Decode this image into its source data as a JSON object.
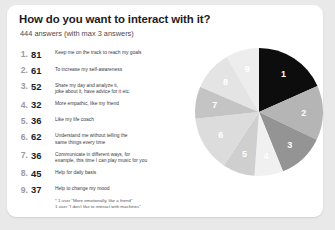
{
  "slide": {
    "title": "How do you want to interact with it?",
    "subtitle": "444 answers  (with max 3 answers)"
  },
  "answers": [
    {
      "rank": "1.",
      "count": "81",
      "text": "Keep me on the track to reach my goals"
    },
    {
      "rank": "2.",
      "count": "61",
      "text": "To increase my self-awareness"
    },
    {
      "rank": "3.",
      "count": "52",
      "text": "Share my day and analyze it,",
      "text2": "joke about it, have advice for it etc."
    },
    {
      "rank": "4.",
      "count": "32",
      "text": "More empathic, like my friend"
    },
    {
      "rank": "5.",
      "count": "36",
      "text": "Like my life coach"
    },
    {
      "rank": "6.",
      "count": "62",
      "text": "Understand me without telling the",
      "text2": "same things every time"
    },
    {
      "rank": "7.",
      "count": "36",
      "text": "Communicate in different ways, for",
      "text2": "example, this time I can play music for you"
    },
    {
      "rank": "8.",
      "count": "45",
      "text": "Help for daily basis"
    },
    {
      "rank": "9.",
      "count": "37",
      "text": "Help to change my mood"
    }
  ],
  "footnotes": [
    "* 1 user \"More emotionally, like a friend\"",
    "1 user \"I don't like to interact with machines\""
  ],
  "chart_data": {
    "type": "pie",
    "title": "How do you want to interact with it?",
    "total": 444,
    "categories": [
      "Keep me on the track to reach my goals",
      "To increase my self-awareness",
      "Share my day and analyze it, joke about it, have advice for it etc.",
      "More empathic, like my friend",
      "Like my life coach",
      "Understand me without telling the same things every time",
      "Communicate in different ways, for example, this time I can play music for you",
      "Help for daily basis",
      "Help to change my mood"
    ],
    "labels": [
      "1",
      "2",
      "3",
      "4",
      "5",
      "6",
      "7",
      "8",
      "9"
    ],
    "values": [
      81,
      61,
      52,
      32,
      36,
      62,
      36,
      45,
      37
    ],
    "colors": [
      "#0d0d0d",
      "#b5b5b5",
      "#949494",
      "#f0f0f0",
      "#cfcfcf",
      "#dcdcdc",
      "#c4c4c4",
      "#e4e4e4",
      "#ededed"
    ],
    "start_angle": 0,
    "direction": "clockwise",
    "legend": "none",
    "grid": false
  }
}
